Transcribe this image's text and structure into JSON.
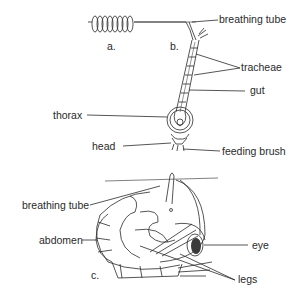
{
  "figure": {
    "panels": [
      {
        "id": "a",
        "label": "a."
      },
      {
        "id": "b",
        "label": "b."
      },
      {
        "id": "c",
        "label": "c."
      }
    ],
    "labels": {
      "breathing_tube_top": "breathing tube",
      "tracheae": "tracheae",
      "gut": "gut",
      "thorax": "thorax",
      "head": "head",
      "feeding_brush": "feeding brush",
      "breathing_tube_bottom": "breathing tube",
      "abdomen": "abdomen",
      "eye": "eye",
      "legs": "legs"
    },
    "colors": {
      "ink": "#2a2a2a",
      "background": "#ffffff"
    }
  }
}
